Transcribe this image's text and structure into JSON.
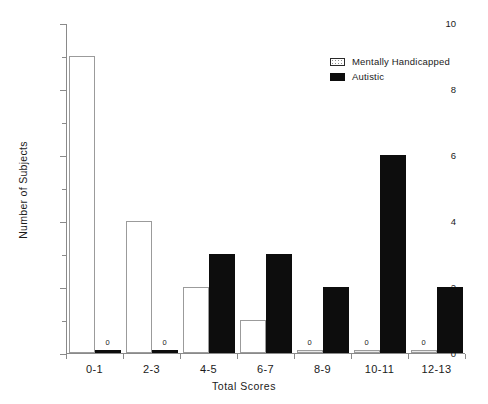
{
  "chart_data": {
    "type": "bar",
    "title": "",
    "xlabel": "Total Scores",
    "ylabel": "Number of Subjects",
    "categories": [
      "0-1",
      "2-3",
      "4-5",
      "6-7",
      "8-9",
      "10-11",
      "12-13"
    ],
    "series": [
      {
        "name": "Mentally Handicapped",
        "fill": "dotted-white",
        "values": [
          9,
          4,
          2,
          1,
          0,
          0,
          0
        ]
      },
      {
        "name": "Autistic",
        "fill": "solid-black",
        "values": [
          0,
          0,
          3,
          3,
          2,
          6,
          2
        ]
      }
    ],
    "ylim": [
      0,
      10
    ],
    "y_major_ticks": [
      0,
      2,
      4,
      6,
      8,
      10
    ],
    "y_minor_ticks": [
      1,
      3,
      5,
      7,
      9
    ],
    "y_tick_labels": [
      "0",
      "2",
      "4",
      "6",
      "8",
      "10"
    ],
    "zero_value_labels": "0",
    "grid": false,
    "legend_position": "top-right"
  },
  "legend": {
    "entries": [
      {
        "label": "Mentally Handicapped"
      },
      {
        "label": "Autistic"
      }
    ]
  },
  "axes": {
    "x_title": "Total Scores",
    "y_title": "Number of Subjects"
  },
  "colors": {
    "bar_autistic": "#0d0d0d",
    "bar_mentally_handicapped": "#ffffff",
    "bar_border": "#9b9b9b",
    "axis": "#8a8a8a",
    "text": "#1a1a1a",
    "background": "#ffffff"
  }
}
